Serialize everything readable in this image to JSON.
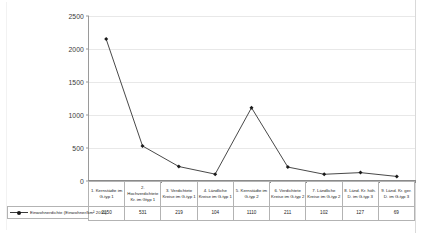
{
  "chart_data": {
    "type": "line",
    "title": "",
    "xlabel": "",
    "ylabel": "",
    "ylim": [
      0,
      2500
    ],
    "ytick_labels": [
      "0",
      "500",
      "1000",
      "1500",
      "2000",
      "2500"
    ],
    "ytick_values": [
      0,
      500,
      1000,
      1500,
      2000,
      2500
    ],
    "grid": true,
    "legend_position": "bottom-left",
    "categories": [
      "1. Kernstädte im G-typ 1",
      "2. Hochverdichtete Kr. im Gtyp 1",
      "3. Verdichtete Kreise im G-typ 1",
      "4. Ländliche Kreise im G-typ 1",
      "5. Kernstädte im G-typ 2",
      "6. Verdichtete Kreise im G-typ 2",
      "7. Ländliche Kreise im G-typ 2",
      "8. Ländl. Kr. höh. D. im G-typ 3",
      "9. Länd. Kr. ger. D. im G-typ 3"
    ],
    "category_lines": [
      [
        "1. Kernstädte im",
        "G-typ 1"
      ],
      [
        "2.",
        "Hochverdichtete",
        "Kr. im Gtyp 1"
      ],
      [
        "3. Verdichtete",
        "Kreise im G-typ 1"
      ],
      [
        "4. Ländliche",
        "Kreise im G-typ 1"
      ],
      [
        "5. Kernstädte im",
        "G-typ 2"
      ],
      [
        "6. Verdichtete",
        "Kreise im G-typ 2"
      ],
      [
        "7. Ländliche",
        "Kreise im G-typ 2"
      ],
      [
        "8. Länd. Kr. höh.",
        "D. im G-typ 3"
      ],
      [
        "9. Länd. Kr. ger.",
        "D. im G-typ 3"
      ]
    ],
    "series": [
      {
        "name": "Einwohnerdichte (Einwohner/km² 2011)",
        "values": [
          2150,
          531,
          219,
          104,
          1110,
          211,
          102,
          127,
          69
        ],
        "value_labels": [
          "2150",
          "531",
          "219",
          "104",
          "1110",
          "211",
          "102",
          "127",
          "69"
        ],
        "color": "#333333",
        "marker": "diamond"
      }
    ]
  },
  "legend": {
    "label": "Einwohnerdichte (Einwohner/km² 2011)"
  }
}
